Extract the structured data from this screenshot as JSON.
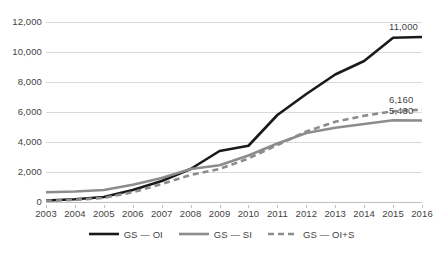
{
  "chart_data": {
    "type": "line",
    "title": "",
    "subtitle": "",
    "xlabel": "",
    "ylabel": "",
    "x": [
      2003,
      2004,
      2005,
      2006,
      2007,
      2008,
      2009,
      2010,
      2011,
      2012,
      2013,
      2014,
      2015,
      2016
    ],
    "categories": [
      "2003",
      "2004",
      "2005",
      "2006",
      "2007",
      "2008",
      "2009",
      "2010",
      "2011",
      "2012",
      "2013",
      "2014",
      "2015",
      "2016"
    ],
    "ylim": [
      0,
      12000
    ],
    "yticks": [
      0,
      2000,
      4000,
      6000,
      8000,
      10000,
      12000
    ],
    "ytick_labels": [
      "0",
      "2,000",
      "4,000",
      "6,000",
      "8,000",
      "10,000",
      "12,000"
    ],
    "grid": "horizontal",
    "legend_position": "bottom-center",
    "series": [
      {
        "name": "GS – OI",
        "style": "solid",
        "color": "#1a1a1a",
        "width": 2.6,
        "values": [
          100,
          180,
          330,
          800,
          1400,
          2200,
          3400,
          3750,
          5800,
          7200,
          8500,
          9400,
          10950,
          11000
        ],
        "end_label": "11,000"
      },
      {
        "name": "GS – SI",
        "style": "solid",
        "color": "#8c8c8c",
        "width": 2.6,
        "values": [
          650,
          700,
          800,
          1150,
          1600,
          2200,
          2450,
          3100,
          3900,
          4600,
          4950,
          5200,
          5450,
          5430
        ],
        "end_label": "5,430"
      },
      {
        "name": "GS – OI+S",
        "style": "dashed",
        "color": "#8c8c8c",
        "width": 2.6,
        "values": [
          80,
          140,
          280,
          650,
          1200,
          1800,
          2200,
          2900,
          3800,
          4700,
          5350,
          5750,
          6050,
          6160
        ],
        "end_label": "6,160"
      }
    ],
    "point_labels": [
      {
        "text": "11,000",
        "series": "GS – OI",
        "x": 2016,
        "y": 11000
      },
      {
        "text": "6,160",
        "series": "GS – OI+S",
        "x": 2016,
        "y": 6160
      },
      {
        "text": "5,430",
        "series": "GS – SI",
        "x": 2016,
        "y": 5430
      }
    ]
  },
  "legend": {
    "items": [
      {
        "label": "GS — OI",
        "icon": "solid-line-swatch"
      },
      {
        "label": "GS — SI",
        "icon": "solid-line-swatch"
      },
      {
        "label": "GS — OI+S",
        "icon": "dashed-line-swatch"
      }
    ]
  },
  "colors": {
    "series_dark": "#1a1a1a",
    "series_gray": "#8c8c8c",
    "gridline": "#d9d9d9",
    "axis": "#bfbfbf",
    "text": "#3f3f3f",
    "background": "#ffffff"
  }
}
